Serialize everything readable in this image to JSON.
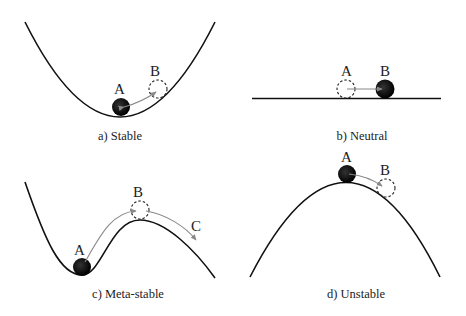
{
  "panels": [
    {
      "id": "a",
      "caption": "a) Stable",
      "labels": {
        "start": "A",
        "end": "B"
      }
    },
    {
      "id": "b",
      "caption": "b) Neutral",
      "labels": {
        "start": "A",
        "end": "B"
      }
    },
    {
      "id": "c",
      "caption": "c) Meta-stable",
      "labels": {
        "start": "A",
        "mid": "B",
        "end": "C"
      }
    },
    {
      "id": "d",
      "caption": "d) Unstable",
      "labels": {
        "start": "A",
        "end": "B"
      }
    }
  ],
  "colors": {
    "curve": "#111111",
    "ball": "#0a0a0a",
    "arrow": "#888888",
    "dashed": "#222222"
  }
}
